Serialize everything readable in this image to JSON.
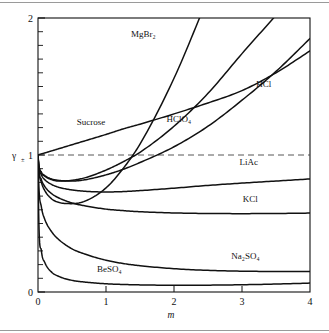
{
  "chart_data": {
    "type": "line",
    "title": "",
    "xlabel": "m",
    "ylabel": "γ±",
    "xlim": [
      0,
      4
    ],
    "ylim": [
      0,
      2
    ],
    "xticks": [
      "0",
      "1",
      "2",
      "3",
      "4"
    ],
    "yticks": [
      "0",
      "1",
      "2"
    ],
    "grid": false,
    "legend": "inline-curve-labels",
    "minor_tick_step_y": 0.1,
    "reference_line": {
      "axis": "y",
      "value": 1,
      "style": "dashed"
    },
    "x": [
      0,
      0.01,
      0.05,
      0.1,
      0.2,
      0.3,
      0.5,
      0.7,
      1.0,
      1.25,
      1.5,
      2.0,
      2.5,
      3.0,
      3.5,
      4.0
    ],
    "series": [
      {
        "name": "Sucrose",
        "label": "Sucrose",
        "label_x": 0.78,
        "label_y": 1.22,
        "values": [
          1.0,
          1.002,
          1.008,
          1.015,
          1.03,
          1.045,
          1.075,
          1.105,
          1.15,
          1.19,
          1.225,
          1.3,
          1.38,
          1.47,
          1.6,
          1.76
        ]
      },
      {
        "name": "MgBr2",
        "label": "MgBr₂",
        "label_x": 1.55,
        "label_y": 1.86,
        "values": [
          1.0,
          0.9,
          0.8,
          0.74,
          0.68,
          0.655,
          0.645,
          0.665,
          0.76,
          0.9,
          1.08,
          1.56,
          2.15,
          null,
          null,
          null
        ]
      },
      {
        "name": "HClO4",
        "label": "HClO₄",
        "label_x": 2.07,
        "label_y": 1.24,
        "values": [
          1.0,
          0.935,
          0.87,
          0.845,
          0.82,
          0.81,
          0.815,
          0.835,
          0.89,
          0.95,
          1.02,
          1.21,
          1.45,
          1.74,
          2.02,
          null
        ]
      },
      {
        "name": "HCl",
        "label": "HCl",
        "label_x": 3.32,
        "label_y": 1.5,
        "values": [
          1.0,
          0.935,
          0.875,
          0.85,
          0.825,
          0.815,
          0.81,
          0.82,
          0.855,
          0.895,
          0.945,
          1.06,
          1.21,
          1.4,
          1.61,
          1.85
        ]
      },
      {
        "name": "LiAc",
        "label": "LiAc",
        "label_x": 3.1,
        "label_y": 0.93,
        "values": [
          1.0,
          0.925,
          0.855,
          0.82,
          0.785,
          0.765,
          0.745,
          0.735,
          0.73,
          0.733,
          0.74,
          0.758,
          0.778,
          0.795,
          0.81,
          0.825
        ]
      },
      {
        "name": "KCl",
        "label": "KCl",
        "label_x": 3.12,
        "label_y": 0.66,
        "values": [
          1.0,
          0.905,
          0.82,
          0.77,
          0.718,
          0.688,
          0.65,
          0.628,
          0.605,
          0.594,
          0.586,
          0.577,
          0.573,
          0.572,
          0.573,
          0.576
        ]
      },
      {
        "name": "Na2SO4",
        "label": "Na₂SO₄",
        "label_x": 3.05,
        "label_y": 0.24,
        "values": [
          1.0,
          0.8,
          0.62,
          0.53,
          0.44,
          0.385,
          0.315,
          0.275,
          0.232,
          0.208,
          0.192,
          0.17,
          0.158,
          0.152,
          0.15,
          0.15
        ]
      },
      {
        "name": "BeSO4",
        "label": "BeSO₄",
        "label_x": 1.05,
        "label_y": 0.145,
        "values": [
          1.0,
          0.57,
          0.3,
          0.215,
          0.145,
          0.115,
          0.085,
          0.072,
          0.06,
          0.055,
          0.052,
          0.049,
          0.05,
          0.053,
          0.058,
          0.065
        ]
      }
    ]
  },
  "axes": {
    "x_label": "m",
    "y_label": "γ",
    "y_label_sub": "±",
    "x_tick_labels": [
      "0",
      "1",
      "2",
      "3",
      "4"
    ],
    "y_tick_labels": [
      "0",
      "1",
      "2"
    ]
  },
  "colors": {
    "curve": "#111111",
    "axis": "#111111",
    "dashed_reference": "#444444",
    "rule": "#9a9a9a",
    "background": "#ffffff"
  }
}
